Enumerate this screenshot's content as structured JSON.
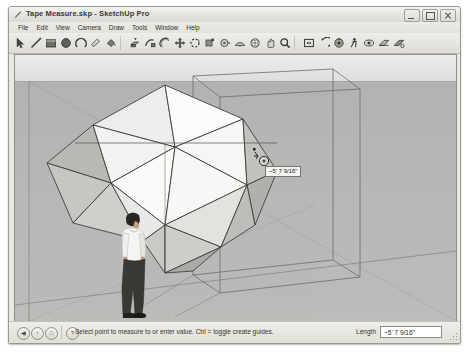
{
  "window": {
    "title": "Tape Measure.skp - SketchUp Pro",
    "app_icon": "pencil-icon",
    "controls": {
      "minimize": "Minimize",
      "maximize": "Maximize",
      "close": "Close"
    }
  },
  "menubar": {
    "items": [
      {
        "label": "File"
      },
      {
        "label": "Edit"
      },
      {
        "label": "View"
      },
      {
        "label": "Camera"
      },
      {
        "label": "Draw"
      },
      {
        "label": "Tools"
      },
      {
        "label": "Window"
      },
      {
        "label": "Help"
      }
    ]
  },
  "toolbar": {
    "groups": [
      {
        "tools": [
          {
            "name": "select-arrow-tool",
            "title": "Select"
          },
          {
            "name": "line-tool",
            "title": "Line"
          },
          {
            "name": "rectangle-tool",
            "title": "Rectangle"
          },
          {
            "name": "circle-tool",
            "title": "Circle"
          },
          {
            "name": "arc-tool",
            "title": "Arc"
          },
          {
            "name": "eraser-tool",
            "title": "Eraser"
          },
          {
            "name": "paint-bucket-tool",
            "title": "Paint Bucket"
          }
        ]
      },
      {
        "tools": [
          {
            "name": "pushpull-tool",
            "title": "Push/Pull"
          },
          {
            "name": "followme-tool",
            "title": "Follow Me"
          },
          {
            "name": "offset-tool",
            "title": "Offset"
          },
          {
            "name": "move-tool",
            "title": "Move"
          },
          {
            "name": "rotate-tool",
            "title": "Rotate"
          },
          {
            "name": "scale-tool",
            "title": "Scale"
          },
          {
            "name": "tape-measure-tool",
            "title": "Tape Measure"
          },
          {
            "name": "protractor-tool",
            "title": "Protractor"
          },
          {
            "name": "orbit-tool",
            "title": "Orbit"
          },
          {
            "name": "pan-tool",
            "title": "Pan"
          },
          {
            "name": "zoom-tool",
            "title": "Zoom"
          }
        ]
      },
      {
        "tools": [
          {
            "name": "zoom-extents-tool",
            "title": "Zoom Extents"
          },
          {
            "name": "previous-view-tool",
            "title": "Previous View"
          },
          {
            "name": "position-camera-tool",
            "title": "Position Camera"
          },
          {
            "name": "walk-tool",
            "title": "Walk"
          },
          {
            "name": "look-around-tool",
            "title": "Look Around"
          },
          {
            "name": "section-plane-tool",
            "title": "Section Plane"
          },
          {
            "name": "section-display-tool",
            "title": "Display Section Cuts"
          }
        ]
      }
    ]
  },
  "viewport": {
    "measurement": {
      "value": "~5' 7 9/16\"",
      "cursor": "tape-measure-cursor"
    },
    "model": {
      "primary": "icosahedron",
      "bounding_box": "wireframe-cube",
      "scale_figure": "person-figure"
    },
    "colors": {
      "sky": "#e8e8e6",
      "ground": "#b7b7b6",
      "face_light": "#f4f4f2",
      "face_mid": "#dcdcda",
      "face_dark": "#b4b4b2",
      "edge": "#3c3c3a",
      "axis_red": "#b05a5a",
      "axis_green": "#6f8f6f",
      "guide": "#7a7a76"
    }
  },
  "statusbar": {
    "buttons": [
      {
        "name": "previous-help-button",
        "glyph": "◀"
      },
      {
        "name": "instructor-button",
        "glyph": "↑"
      },
      {
        "name": "next-help-button",
        "glyph": "□"
      },
      {
        "name": "help-button",
        "glyph": "?"
      }
    ],
    "status_text": "Select point to measure to or enter value.  Ctrl = toggle create guides.",
    "length_label": "Length",
    "length_value": "~5' 7 9/16\""
  }
}
